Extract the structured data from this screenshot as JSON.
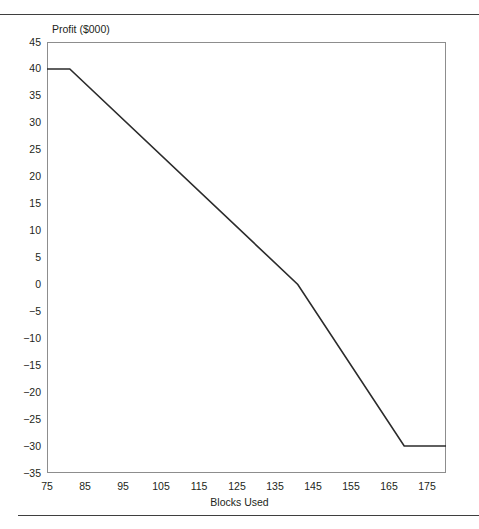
{
  "chart_data": {
    "type": "line",
    "title": "",
    "xlabel": "Blocks Used",
    "ylabel": "Profit ($000)",
    "xlim": [
      75,
      180
    ],
    "ylim": [
      -35,
      45
    ],
    "xticks": [
      75,
      85,
      95,
      105,
      115,
      125,
      135,
      145,
      155,
      165,
      175
    ],
    "yticks": [
      45,
      40,
      35,
      30,
      25,
      20,
      15,
      10,
      5,
      0,
      -5,
      -10,
      -15,
      -20,
      -25,
      -30,
      -35
    ],
    "ytick_labels": [
      "45",
      "40",
      "35",
      "30",
      "25",
      "20",
      "15",
      "10",
      "5",
      "0",
      "−5",
      "−10",
      "−15",
      "−20",
      "−25",
      "−30",
      "−35"
    ],
    "xtick_labels": [
      "75",
      "85",
      "95",
      "105",
      "115",
      "125",
      "135",
      "145",
      "155",
      "165",
      "175"
    ],
    "grid": false,
    "legend": "none",
    "series": [
      {
        "name": "Profit",
        "color": "#2b2b2b",
        "x": [
          75,
          81,
          141,
          169,
          180
        ],
        "values": [
          40,
          40,
          0,
          -30,
          -30
        ]
      }
    ]
  },
  "figure": {
    "y_axis_title": "Profit ($000)",
    "x_axis_title": "Blocks Used",
    "line_color": "#2b2b2b",
    "frame_color": "#8d8d8d",
    "rule_color": "#3f3f3f"
  }
}
